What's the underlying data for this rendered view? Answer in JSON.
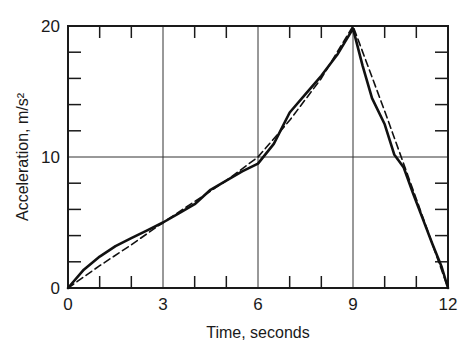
{
  "chart_data": {
    "type": "line",
    "title": "",
    "xlabel": "Time, seconds",
    "ylabel": "Acceleration, m/s²",
    "xlim": [
      0,
      12
    ],
    "ylim": [
      0,
      20
    ],
    "x_ticks": [
      0,
      3,
      6,
      9,
      12
    ],
    "y_ticks": [
      0,
      10,
      20
    ],
    "x_minor_ticks": [
      1,
      2,
      4,
      5,
      7,
      8,
      10,
      11
    ],
    "y_minor_ticks": [
      2,
      4,
      6,
      8,
      12,
      14,
      16,
      18
    ],
    "grid": {
      "x": [
        3,
        6,
        9
      ],
      "y": [
        10
      ]
    },
    "legend": null,
    "series": [
      {
        "name": "measured",
        "style": "solid",
        "x": [
          0,
          0.5,
          1,
          1.5,
          2,
          2.5,
          3,
          3.5,
          4,
          4.5,
          5,
          5.5,
          6,
          6.5,
          7,
          7.5,
          8,
          8.5,
          9,
          9.3,
          9.6,
          10,
          10.3,
          10.6,
          10.9,
          11.2,
          11.5,
          11.8,
          12
        ],
        "y": [
          0,
          1.4,
          2.4,
          3.2,
          3.8,
          4.4,
          5.0,
          5.7,
          6.4,
          7.5,
          8.2,
          8.9,
          9.5,
          11.0,
          13.4,
          14.8,
          16.2,
          17.8,
          19.8,
          17.0,
          14.5,
          12.5,
          10.2,
          9.2,
          7.2,
          5.3,
          3.4,
          1.6,
          0
        ]
      },
      {
        "name": "approximation",
        "style": "dashed",
        "x": [
          0,
          1,
          2,
          3,
          4,
          5,
          6,
          7,
          8,
          9,
          10,
          11,
          12
        ],
        "y": [
          0,
          1.7,
          3.3,
          5.0,
          6.6,
          8.2,
          10.0,
          12.8,
          16.0,
          20.0,
          13.5,
          6.8,
          0
        ]
      }
    ]
  },
  "axes": {
    "x_title": "Time, seconds",
    "y_title": "Acceleration, m/s²",
    "x_tick_labels": [
      "0",
      "3",
      "6",
      "9",
      "12"
    ],
    "y_tick_labels": [
      "0",
      "10",
      "20"
    ]
  }
}
